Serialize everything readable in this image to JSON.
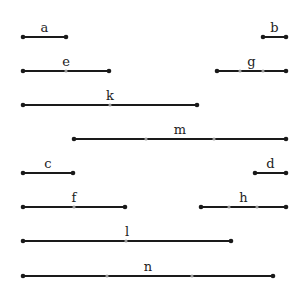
{
  "diagram": {
    "type": "interval-segments",
    "segments": [
      {
        "label": "a",
        "x1": 23,
        "x2": 66,
        "y": 37,
        "mids": []
      },
      {
        "label": "b",
        "x1": 263,
        "x2": 286,
        "y": 37,
        "mids": []
      },
      {
        "label": "e",
        "x1": 23,
        "x2": 109,
        "y": 71,
        "mids": [
          66
        ]
      },
      {
        "label": "g",
        "x1": 217,
        "x2": 286,
        "y": 71,
        "mids": [
          240,
          263
        ]
      },
      {
        "label": "k",
        "x1": 23,
        "x2": 197,
        "y": 105,
        "mids": [
          110
        ]
      },
      {
        "label": "m",
        "x1": 74,
        "x2": 286,
        "y": 139,
        "mids": [
          146,
          214
        ]
      },
      {
        "label": "c",
        "x1": 23,
        "x2": 73,
        "y": 173,
        "mids": []
      },
      {
        "label": "d",
        "x1": 255,
        "x2": 286,
        "y": 173,
        "mids": []
      },
      {
        "label": "f",
        "x1": 23,
        "x2": 125,
        "y": 207,
        "mids": [
          74
        ]
      },
      {
        "label": "h",
        "x1": 201,
        "x2": 286,
        "y": 207,
        "mids": [
          229,
          257
        ]
      },
      {
        "label": "l",
        "x1": 23,
        "x2": 231,
        "y": 241,
        "mids": [
          126
        ]
      },
      {
        "label": "n",
        "x1": 23,
        "x2": 273,
        "y": 276,
        "mids": [
          107,
          192
        ]
      }
    ]
  }
}
